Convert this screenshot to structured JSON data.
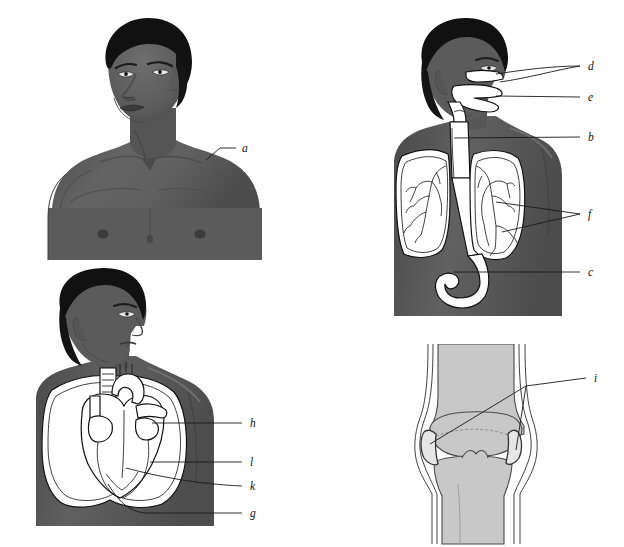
{
  "figure": {
    "title": "",
    "background_color": "#ffffff",
    "skin_color": "#595959",
    "skin_shadow_color": "#4a4a4a",
    "skin_highlight_color": "#6b6b6b",
    "hair_color": "#111111",
    "organ_fill_color": "#ffffff",
    "organ_stroke_color": "#111111",
    "bone_fill_color": "#c8c8c8",
    "cartilage_fill_color": "#e6e6e6",
    "leader_line_color": "#1a1a1a",
    "label_text_color": "#111111"
  },
  "panels": [
    {
      "id": "panel-external",
      "name": "external-body-head-and-torso",
      "description": "Front view of head, neck, shoulders and upper chest",
      "labels": [
        {
          "key": "a",
          "text": "a",
          "x": 212,
          "y": 140,
          "target": "shoulder / skin surface"
        }
      ]
    },
    {
      "id": "panel-resp",
      "name": "respiratory-and-upper-digestive-tract",
      "description": "Profile view showing nasal cavity, mouth, pharynx, trachea, lungs, bronchial tree and stomach",
      "labels": [
        {
          "key": "d",
          "text": "d",
          "x": 198,
          "y": 54,
          "target": "nasal cavity / nostrils"
        },
        {
          "key": "e",
          "text": "e",
          "x": 198,
          "y": 85,
          "target": "mouth / oral cavity"
        },
        {
          "key": "b",
          "text": "b",
          "x": 198,
          "y": 125,
          "target": "trachea"
        },
        {
          "key": "f",
          "text": "f",
          "x": 198,
          "y": 202,
          "target": "bronchi / bronchial tree"
        },
        {
          "key": "c",
          "text": "c",
          "x": 198,
          "y": 260,
          "target": "stomach"
        }
      ]
    },
    {
      "id": "panel-cardio",
      "name": "heart-and-lungs",
      "description": "Profile view of head and torso showing heart within the lungs",
      "labels": [
        {
          "key": "h",
          "text": "h",
          "x": 214,
          "y": 159,
          "target": "lung"
        },
        {
          "key": "l",
          "text": "l",
          "x": 214,
          "y": 198,
          "target": "heart chamber / ventricle"
        },
        {
          "key": "k",
          "text": "k",
          "x": 214,
          "y": 222,
          "target": "heart wall"
        },
        {
          "key": "g",
          "text": "g",
          "x": 214,
          "y": 249,
          "target": "apex of heart"
        }
      ]
    },
    {
      "id": "panel-knee",
      "name": "knee-joint-cross-section",
      "description": "Cross section of knee joint showing femur, tibia, cartilage and menisci",
      "labels": [
        {
          "key": "i",
          "text": "i",
          "x": 186,
          "y": 38,
          "target": "menisci / articular cartilage"
        }
      ]
    }
  ],
  "label_keys": [
    "a",
    "b",
    "c",
    "d",
    "e",
    "f",
    "g",
    "h",
    "i",
    "k",
    "l"
  ]
}
